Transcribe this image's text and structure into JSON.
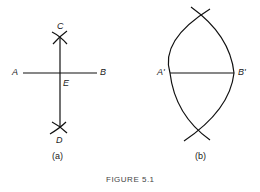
{
  "figure": {
    "caption": "FIGURE 5.1",
    "panel_a": {
      "label": "(a)",
      "points": {
        "A": "A",
        "B": "B",
        "C": "C",
        "D": "D",
        "E": "E"
      }
    },
    "panel_b": {
      "label": "(b)",
      "points": {
        "A_prime": "A'",
        "B_prime": "B'"
      }
    },
    "stroke_color": "#111111"
  }
}
